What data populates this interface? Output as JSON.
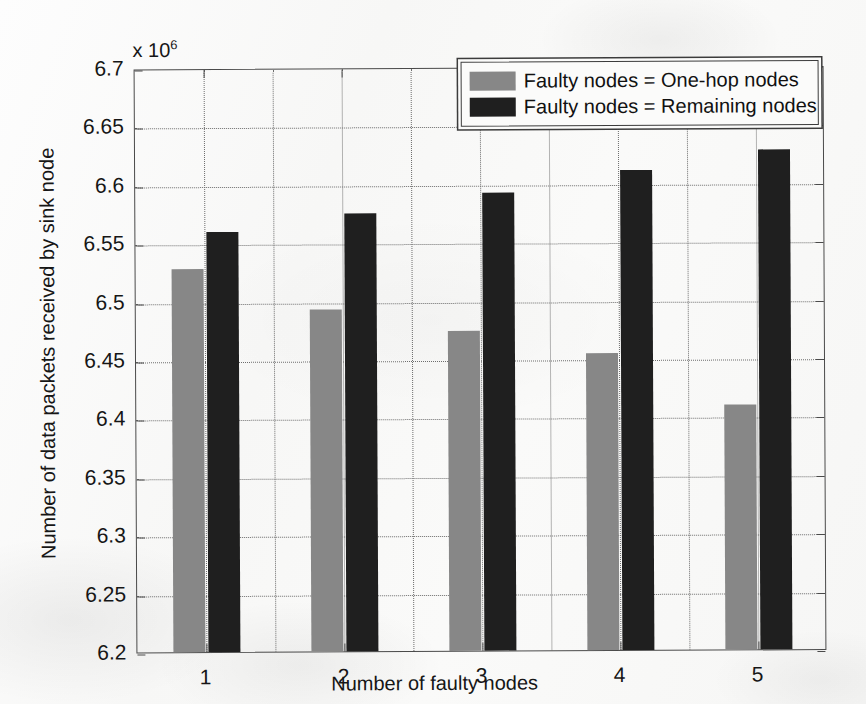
{
  "chart_data": {
    "type": "bar",
    "title": "",
    "xlabel": "Number of faulty nodes",
    "ylabel": "Number of data packets received by sink node",
    "y_exponent_label": "x 10",
    "y_exponent_power": "6",
    "y_multiplier": 1000000,
    "categories": [
      "1",
      "2",
      "3",
      "4",
      "5"
    ],
    "ylim": [
      6.2,
      6.7
    ],
    "yticks": [
      "6.2",
      "6.25",
      "6.3",
      "6.35",
      "6.4",
      "6.45",
      "6.5",
      "6.55",
      "6.6",
      "6.65",
      "6.7"
    ],
    "grid": true,
    "legend_position": "top-right",
    "series": [
      {
        "name": "Faulty nodes = One-hop nodes",
        "color": "#878787",
        "values": [
          6.528,
          6.493,
          6.474,
          6.454,
          6.41
        ]
      },
      {
        "name": "Faulty nodes = Remaining nodes",
        "color": "#1f1f1f",
        "values": [
          6.56,
          6.575,
          6.592,
          6.611,
          6.628
        ]
      }
    ]
  },
  "legend": {
    "entries": [
      "Faulty nodes = One-hop nodes",
      "Faulty nodes = Remaining nodes"
    ]
  }
}
